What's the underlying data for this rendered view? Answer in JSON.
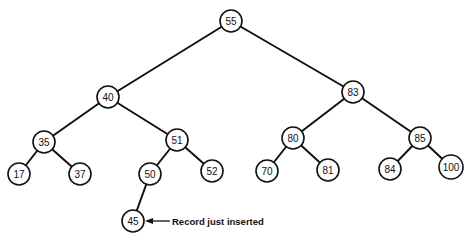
{
  "diagram": {
    "title": "",
    "type": "binary-search-tree",
    "node_radius": 11,
    "colors": {
      "stroke": "#111111",
      "fill": "#ffffff",
      "text": "#111111",
      "background": "#ffffff"
    },
    "nodes": [
      {
        "id": "n55",
        "label": "55",
        "x": 231,
        "y": 21
      },
      {
        "id": "n40",
        "label": "40",
        "x": 108,
        "y": 97
      },
      {
        "id": "n83",
        "label": "83",
        "x": 353,
        "y": 92
      },
      {
        "id": "n35",
        "label": "35",
        "x": 44,
        "y": 142
      },
      {
        "id": "n51",
        "label": "51",
        "x": 177,
        "y": 140
      },
      {
        "id": "n80",
        "label": "80",
        "x": 293,
        "y": 138
      },
      {
        "id": "n85",
        "label": "85",
        "x": 420,
        "y": 138
      },
      {
        "id": "n17",
        "label": "17",
        "x": 19,
        "y": 174
      },
      {
        "id": "n37",
        "label": "37",
        "x": 80,
        "y": 174
      },
      {
        "id": "n50",
        "label": "50",
        "x": 150,
        "y": 174
      },
      {
        "id": "n52",
        "label": "52",
        "x": 212,
        "y": 171
      },
      {
        "id": "n70",
        "label": "70",
        "x": 267,
        "y": 171
      },
      {
        "id": "n81",
        "label": "81",
        "x": 328,
        "y": 170
      },
      {
        "id": "n84",
        "label": "84",
        "x": 390,
        "y": 169
      },
      {
        "id": "n100",
        "label": "100",
        "x": 451,
        "y": 167
      },
      {
        "id": "n45",
        "label": "45",
        "x": 133,
        "y": 221
      }
    ],
    "edges": [
      {
        "from": "n55",
        "to": "n40"
      },
      {
        "from": "n55",
        "to": "n83"
      },
      {
        "from": "n40",
        "to": "n35"
      },
      {
        "from": "n40",
        "to": "n51"
      },
      {
        "from": "n35",
        "to": "n17"
      },
      {
        "from": "n35",
        "to": "n37"
      },
      {
        "from": "n51",
        "to": "n50"
      },
      {
        "from": "n51",
        "to": "n52"
      },
      {
        "from": "n50",
        "to": "n45"
      },
      {
        "from": "n83",
        "to": "n80"
      },
      {
        "from": "n83",
        "to": "n85"
      },
      {
        "from": "n80",
        "to": "n70"
      },
      {
        "from": "n80",
        "to": "n81"
      },
      {
        "from": "n85",
        "to": "n84"
      },
      {
        "from": "n85",
        "to": "n100"
      }
    ],
    "annotation": {
      "text": "Record just inserted",
      "target": "n45",
      "arrow_start_x": 170,
      "arrow_end_x": 145,
      "y": 221,
      "text_x": 172
    }
  }
}
